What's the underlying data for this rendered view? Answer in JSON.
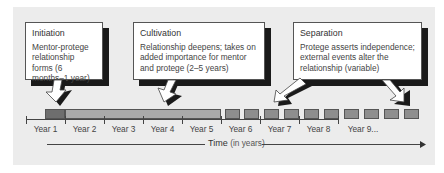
{
  "stages": [
    {
      "title": "Initiation",
      "description": "Mentor-protege relationship forms (6 months–1 year)"
    },
    {
      "title": "Cultivation",
      "description": "Relationship deepens; takes on added importance for mentor and protege (2–5 years)"
    },
    {
      "title": "Separation",
      "description": "Protege asserts independence; external events alter the relationship (variable)"
    }
  ],
  "timeline": {
    "years": [
      "Year 1",
      "Year 2",
      "Year 3",
      "Year 4",
      "Year 5",
      "Year 6",
      "Year 7",
      "Year 8",
      "Year 9..."
    ],
    "axis_label": "Time",
    "axis_label_unit": "(in years)"
  },
  "colors": {
    "panel": "#ececec",
    "initiation_bar": "#6e6e6e",
    "cultivation_bar": "#a9a9a9",
    "separation_segment": "#8e8e8e",
    "shadow": "#1a1a1a"
  }
}
